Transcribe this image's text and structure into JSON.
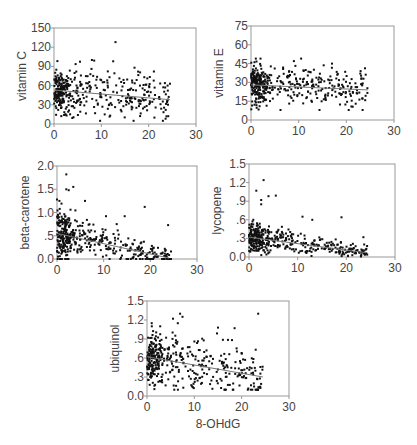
{
  "chart_data": [
    {
      "type": "scatter",
      "title": "",
      "xlabel": "",
      "ylabel": "vitamin C",
      "xlim": [
        0,
        30
      ],
      "ylim": [
        0,
        150
      ],
      "xticks": [
        0,
        10,
        20,
        30
      ],
      "yticks": [
        0,
        30,
        60,
        90,
        120,
        150
      ],
      "ytick_labels": [
        "0",
        "30",
        "60",
        "90",
        "120",
        "150"
      ],
      "trend": {
        "x": [
          0,
          24.5
        ],
        "y": [
          53,
          38
        ]
      },
      "cluster": {
        "x_peak": 1.5,
        "y_center": 52,
        "y_spread": 18,
        "x_max": 24.5,
        "n": 420,
        "y_min": 5,
        "y_max": 100
      },
      "outliers": [
        [
          13,
          128
        ],
        [
          8,
          100
        ],
        [
          8.5,
          99
        ],
        [
          12.5,
          98
        ],
        [
          17,
          88
        ],
        [
          23.5,
          57
        ],
        [
          24,
          60
        ],
        [
          24.5,
          63
        ]
      ],
      "box": {
        "x": 54,
        "y": 28,
        "w": 142,
        "h": 96
      }
    },
    {
      "type": "scatter",
      "title": "",
      "xlabel": "",
      "ylabel": "vitamin E",
      "xlim": [
        0,
        30
      ],
      "ylim": [
        0,
        75
      ],
      "xticks": [
        0,
        10,
        20,
        30
      ],
      "yticks": [
        0,
        15,
        30,
        45,
        60,
        75
      ],
      "ytick_labels": [
        "0",
        "15",
        "30",
        "45",
        "60",
        "75"
      ],
      "trend": {
        "x": [
          0,
          24.5
        ],
        "y": [
          28,
          24
        ]
      },
      "cluster": {
        "x_peak": 1.5,
        "y_center": 26,
        "y_spread": 8,
        "x_max": 24.5,
        "n": 420,
        "y_min": 8,
        "y_max": 50
      },
      "outliers": [
        [
          1,
          49
        ],
        [
          2,
          49
        ],
        [
          10.5,
          49
        ],
        [
          9,
          47
        ],
        [
          17,
          45
        ],
        [
          23,
          39
        ],
        [
          20.5,
          8
        ]
      ],
      "box": {
        "x": 251,
        "y": 26,
        "w": 143,
        "h": 94
      }
    },
    {
      "type": "scatter",
      "title": "",
      "xlabel": "",
      "ylabel": "beta-carotene",
      "xlim": [
        0,
        30
      ],
      "ylim": [
        0,
        2.0
      ],
      "xticks": [
        0,
        10,
        20,
        30
      ],
      "yticks": [
        0,
        0.5,
        1.0,
        1.5,
        2.0
      ],
      "ytick_labels": [
        "0.0",
        ".5",
        "1.0",
        "1.5",
        "2.0"
      ],
      "trend": {
        "x": [
          0,
          24
        ],
        "y": [
          0.55,
          0.02
        ]
      },
      "cluster": {
        "x_peak": 1.5,
        "y_center": 0.35,
        "y_spread": 0.25,
        "x_max": 24.5,
        "n": 420,
        "y_min": 0.0,
        "y_max": 1.25,
        "decay": true
      },
      "outliers": [
        [
          2,
          1.82
        ],
        [
          3.5,
          1.55
        ],
        [
          2,
          1.5
        ],
        [
          2.5,
          1.48
        ],
        [
          0,
          1.28
        ],
        [
          6,
          1.25
        ],
        [
          18.8,
          1.12
        ],
        [
          10.5,
          0.92
        ],
        [
          14.5,
          0.92
        ],
        [
          23.8,
          0.73
        ],
        [
          12.8,
          0.75
        ]
      ],
      "box": {
        "x": 57,
        "y": 166,
        "w": 140,
        "h": 93
      }
    },
    {
      "type": "scatter",
      "title": "",
      "xlabel": "",
      "ylabel": "lycopene",
      "xlim": [
        0,
        30
      ],
      "ylim": [
        0,
        1.5
      ],
      "xticks": [
        0,
        10,
        20,
        30
      ],
      "yticks": [
        0,
        0.3,
        0.6,
        0.9,
        1.2,
        1.5
      ],
      "ytick_labels": [
        "0.0",
        ".3",
        ".6",
        ".9",
        "1.2",
        "1.5"
      ],
      "trend": {
        "x": [
          0,
          24
        ],
        "y": [
          0.32,
          0.07
        ]
      },
      "cluster": {
        "x_peak": 1.5,
        "y_center": 0.22,
        "y_spread": 0.12,
        "x_max": 24.5,
        "n": 420,
        "y_min": 0.0,
        "y_max": 0.6,
        "decay": true
      },
      "outliers": [
        [
          3,
          1.24
        ],
        [
          1.5,
          1.07
        ],
        [
          4,
          0.98
        ],
        [
          5.5,
          0.99
        ],
        [
          2.5,
          0.92
        ],
        [
          2.5,
          0.85
        ],
        [
          11,
          0.65
        ],
        [
          19,
          0.64
        ],
        [
          13,
          0.6
        ],
        [
          23.5,
          0.32
        ]
      ],
      "box": {
        "x": 249,
        "y": 164,
        "w": 146,
        "h": 93
      }
    },
    {
      "type": "scatter",
      "title": "",
      "xlabel": "8-OHdG",
      "ylabel": "ubiquinol",
      "xlim": [
        0,
        30
      ],
      "ylim": [
        0,
        1.5
      ],
      "xticks": [
        0,
        10,
        20,
        30
      ],
      "yticks": [
        0,
        0.3,
        0.6,
        0.9,
        1.2,
        1.5
      ],
      "ytick_labels": [
        "0.0",
        ".3",
        ".6",
        ".9",
        "1.2",
        "1.5"
      ],
      "trend": {
        "x": [
          0,
          24.5
        ],
        "y": [
          0.62,
          0.3
        ]
      },
      "cluster": {
        "x_peak": 1.5,
        "y_center": 0.5,
        "y_spread": 0.2,
        "x_max": 24.5,
        "n": 420,
        "y_min": 0.1,
        "y_max": 1.1
      },
      "outliers": [
        [
          7,
          1.3
        ],
        [
          7.5,
          1.25
        ],
        [
          5.5,
          1.22
        ],
        [
          6.5,
          1.15
        ],
        [
          23.5,
          1.3
        ],
        [
          1,
          1.15
        ],
        [
          18.5,
          1.07
        ],
        [
          15,
          1.08
        ]
      ],
      "box": {
        "x": 147,
        "y": 301,
        "w": 142,
        "h": 95
      }
    }
  ],
  "shared": {
    "xlabel": "8-OHdG",
    "point_color": "#111111",
    "axis_color": "#999999",
    "trend_color": "#777777"
  }
}
